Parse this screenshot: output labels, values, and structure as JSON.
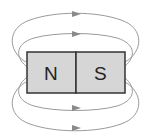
{
  "diagram": {
    "magnet": {
      "north_label": "N",
      "south_label": "S",
      "fill_color": "#d6d6d6",
      "border_color": "#333333"
    },
    "field_lines": {
      "count": 4,
      "direction": "north-to-south (arrows point right)",
      "color": "#9a9a9a"
    }
  }
}
